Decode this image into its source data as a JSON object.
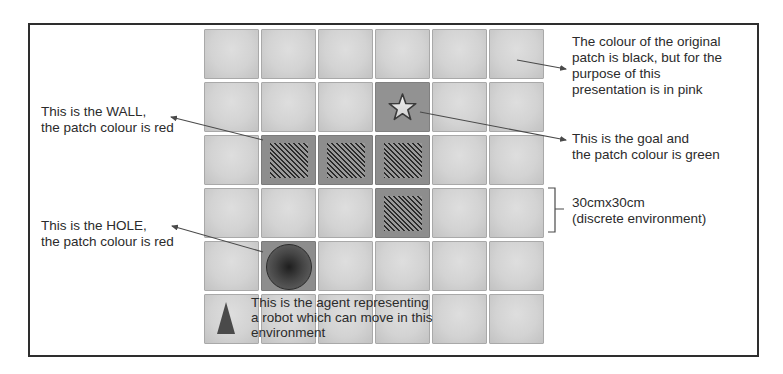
{
  "figure": {
    "grid": {
      "rows": 6,
      "cols": 6,
      "cells": [
        [
          "empty",
          "empty",
          "empty",
          "empty",
          "empty",
          "empty"
        ],
        [
          "empty",
          "empty",
          "empty",
          "goal",
          "empty",
          "empty"
        ],
        [
          "empty",
          "wall",
          "wall",
          "wall",
          "empty",
          "empty"
        ],
        [
          "empty",
          "empty",
          "empty",
          "wall",
          "empty",
          "empty"
        ],
        [
          "empty",
          "hole",
          "empty",
          "empty",
          "empty",
          "empty"
        ],
        [
          "agent",
          "empty",
          "empty",
          "empty",
          "empty",
          "empty"
        ]
      ],
      "icons": {
        "goal": "star-icon",
        "wall": "hatched-square-icon",
        "hole": "dark-circle-icon",
        "agent": "triangle-icon"
      }
    },
    "annotations": {
      "wall": {
        "line1": "This is the WALL,",
        "line2": "the patch colour is red"
      },
      "hole": {
        "line1": "This is the HOLE,",
        "line2": "the patch colour is red"
      },
      "original_patch": {
        "line1": "The colour of the original",
        "line2": "patch is black, but for the",
        "line3": "purpose of this",
        "line4": "presentation is in pink"
      },
      "goal": {
        "line1": "This is the goal and",
        "line2": "the patch colour is green"
      },
      "cell_size": {
        "line1": "30cmx30cm",
        "line2": "(discrete environment)"
      },
      "agent": {
        "line1": "This is the agent representing",
        "line2": "a robot which can move in this",
        "line3": "environment"
      }
    },
    "colors": {
      "frame": "#2e2e2e",
      "empty_patch": "#d3d3d3",
      "special_patch": "#8d8d8d",
      "agent": "#4a4a4a",
      "arrow": "#4a4a4a"
    }
  }
}
